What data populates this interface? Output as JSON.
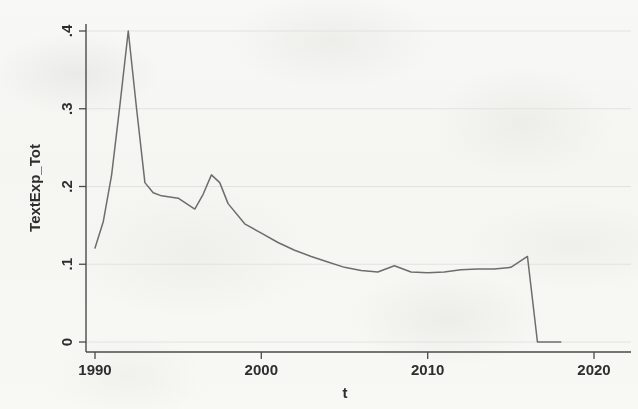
{
  "figure": {
    "background_color": "#fbfbfa",
    "plot_line_color": "#6d6d6d",
    "axis_color": "#4a4a4a",
    "grid_color": "#e2e2e0"
  },
  "chart_data": {
    "type": "line",
    "title": "",
    "xlabel": "t",
    "ylabel": "TextExp_Tot",
    "xlim": [
      1989.0,
      1990.0
    ],
    "ylim": [
      0,
      0.42
    ],
    "xticks": [
      1990,
      2000,
      2010,
      2020
    ],
    "xtick_labels": [
      "1990",
      "2000",
      "2010",
      "2020"
    ],
    "yticks": [
      0,
      0.1,
      0.2,
      0.3,
      0.4
    ],
    "ytick_labels": [
      "0",
      ".1",
      ".2",
      ".3",
      ".4"
    ],
    "grid": "horizontal",
    "legend": "none",
    "series": [
      {
        "name": "TextExp_Tot",
        "color": "#6d6d6d",
        "x": [
          1990.0,
          1990.5,
          1991.0,
          1991.5,
          1992.0,
          1992.5,
          1993.0,
          1993.5,
          1994.0,
          1995.0,
          1996.0,
          1996.5,
          1997.0,
          1997.5,
          1998.0,
          1999.0,
          2000.0,
          2001.0,
          2002.0,
          2003.0,
          2004.0,
          2005.0,
          2006.0,
          2007.0,
          2008.0,
          2009.0,
          2010.0,
          2011.0,
          2012.0,
          2013.0,
          2014.0,
          2015.0,
          2016.0,
          2016.6,
          2018.0
        ],
        "y": [
          0.121,
          0.155,
          0.215,
          0.305,
          0.4,
          0.3,
          0.205,
          0.192,
          0.188,
          0.185,
          0.171,
          0.19,
          0.215,
          0.205,
          0.178,
          0.152,
          0.14,
          0.128,
          0.118,
          0.11,
          0.103,
          0.096,
          0.092,
          0.09,
          0.098,
          0.09,
          0.089,
          0.09,
          0.093,
          0.094,
          0.094,
          0.096,
          0.11,
          0.0,
          0.0
        ]
      }
    ],
    "annotations": {
      "primary_peak": {
        "x": 1992,
        "y": 0.4
      },
      "secondary_peak": {
        "x": 1997,
        "y": 0.215
      },
      "plateau_level": 0.09,
      "terminal_drop": {
        "from": 0.11,
        "to": 0.0,
        "at": 2016.6
      }
    }
  }
}
